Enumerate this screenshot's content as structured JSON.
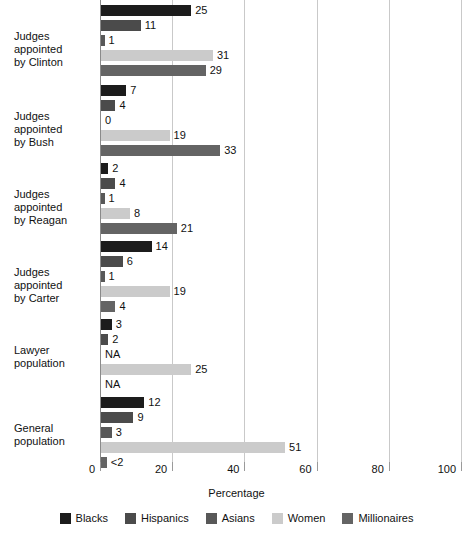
{
  "chart_data": {
    "type": "bar",
    "orientation": "horizontal",
    "title": "",
    "xlabel": "Percentage",
    "ylabel": "",
    "xlim": [
      0,
      100
    ],
    "xticks": [
      0,
      20,
      40,
      60,
      80,
      100
    ],
    "grid": "vertical",
    "legend_position": "bottom",
    "categories": [
      "Judges appointed by Clinton",
      "Judges appointed by Bush",
      "Judges appointed by Reagan",
      "Judges appointed by Carter",
      "Lawyer population",
      "General population"
    ],
    "series": [
      {
        "name": "Blacks",
        "color": "#1c1c1c",
        "values": [
          25,
          7,
          2,
          14,
          3,
          12
        ],
        "labels": [
          "25",
          "7",
          "2",
          "14",
          "3",
          "12"
        ]
      },
      {
        "name": "Hispanics",
        "color": "#4b4b4b",
        "values": [
          11,
          4,
          4,
          6,
          2,
          9
        ],
        "labels": [
          "11",
          "4",
          "4",
          "6",
          "2",
          "9"
        ]
      },
      {
        "name": "Asians",
        "color": "#585858",
        "values": [
          1,
          0,
          1,
          1,
          null,
          3
        ],
        "labels": [
          "1",
          "0",
          "1",
          "1",
          "NA",
          "3"
        ]
      },
      {
        "name": "Women",
        "color": "#cbcbcb",
        "values": [
          31,
          19,
          8,
          19,
          25,
          51
        ],
        "labels": [
          "31",
          "19",
          "8",
          "19",
          "25",
          "51"
        ]
      },
      {
        "name": "Millionaires",
        "color": "#646464",
        "values": [
          29,
          33,
          21,
          4,
          null,
          1.6
        ],
        "labels": [
          "29",
          "33",
          "21",
          "4",
          "NA",
          "<2"
        ]
      }
    ]
  },
  "group_labels": [
    {
      "line1": "Judges appointed",
      "line2": "by Clinton"
    },
    {
      "line1": "Judges appointed",
      "line2": "by Bush"
    },
    {
      "line1": "Judges appointed",
      "line2": "by Reagan"
    },
    {
      "line1": "Judges appointed",
      "line2": "by Carter"
    },
    {
      "line1": "Lawyer",
      "line2": "population"
    },
    {
      "line1": "General",
      "line2": "population"
    }
  ],
  "axis": {
    "title": "Percentage",
    "tick_labels": [
      "0",
      "20",
      "40",
      "60",
      "80",
      "100"
    ]
  },
  "legend": {
    "items": [
      {
        "label": "Blacks",
        "color": "#1c1c1c"
      },
      {
        "label": "Hispanics",
        "color": "#4b4b4b"
      },
      {
        "label": "Asians",
        "color": "#585858"
      },
      {
        "label": "Women",
        "color": "#cbcbcb"
      },
      {
        "label": "Millionaires",
        "color": "#646464"
      }
    ]
  }
}
